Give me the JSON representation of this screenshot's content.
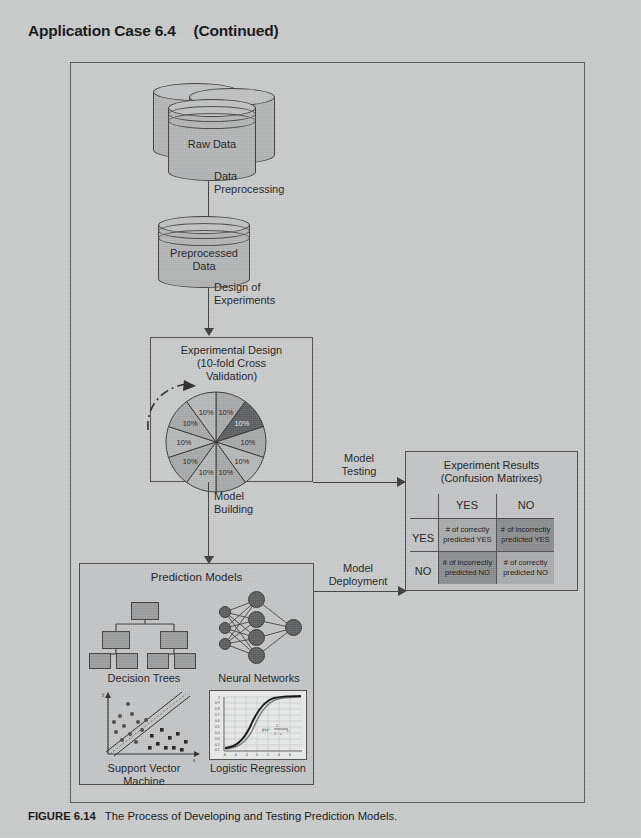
{
  "header": {
    "case_title": "Application Case 6.4",
    "continued": "(Continued)"
  },
  "caption": {
    "figure_number": "FIGURE 6.14",
    "text": "The Process of Developing and Testing Prediction Models."
  },
  "flow": {
    "raw_data": "Raw Data",
    "preprocessed_data": "Preprocessed\nData",
    "preprocessed_line1": "Preprocessed",
    "preprocessed_line2": "Data",
    "arrow1_line1": "Data",
    "arrow1_line2": "Preprocessing",
    "arrow2_line1": "Design of",
    "arrow2_line2": "Experiments",
    "model_building_line1": "Model",
    "model_building_line2": "Building",
    "model_testing_line1": "Model",
    "model_testing_line2": "Testing",
    "model_deployment_line1": "Model",
    "model_deployment_line2": "Deployment"
  },
  "experimental_design": {
    "title_line1": "Experimental Design",
    "title_line2": "(10-fold Cross",
    "title_line3": "Validation)",
    "pie_slice_label": "10%",
    "slice_count": 10,
    "highlighted_slice_index": 1,
    "colors": {
      "slice_light": "#a7a9aa",
      "slice_mid": "#b6b8b9",
      "slice_highlight": "#5d5f60"
    }
  },
  "experiment_results": {
    "title_line1": "Experiment Results",
    "title_line2": "(Confusion Matrixes)",
    "col_headers": [
      "YES",
      "NO"
    ],
    "row_headers": [
      "YES",
      "NO"
    ],
    "cells": [
      [
        "# of correctly\npredicted YES",
        "# of incorrectly\npredicted YES"
      ],
      [
        "# of incorrectly\npredicted NO",
        "# of correctly\npredicted NO"
      ]
    ],
    "cells_flat": {
      "tp_line1": "# of correctly",
      "tp_line2": "predicted YES",
      "fp_line1": "# of incorrectly",
      "fp_line2": "predicted YES",
      "fn_line1": "# of incorrectly",
      "fn_line2": "predicted NO",
      "tn_line1": "# of correctly",
      "tn_line2": "predicted NO"
    },
    "colors": {
      "correct_cell": "#a9abac",
      "incorrect_cell": "#8b8d8e"
    }
  },
  "prediction_models": {
    "title": "Prediction Models",
    "items": [
      {
        "label_line1": "Decision Trees",
        "label_line2": "",
        "icon": "decision-tree-icon"
      },
      {
        "label_line1": "Neural Networks",
        "label_line2": "",
        "icon": "neural-network-icon"
      },
      {
        "label_line1": "Support Vector",
        "label_line2": "Machine",
        "icon": "svm-scatter-icon"
      },
      {
        "label_line1": "Logistic Regression",
        "label_line2": "",
        "icon": "logistic-curve-icon"
      }
    ],
    "logistic_chart": {
      "y_ticks": [
        "1",
        "0.9",
        "0.8",
        "0.7",
        "0.6",
        "0.5",
        "0.4",
        "0.3",
        "0.2",
        "0.1"
      ],
      "x_ticks": [
        "-6",
        "-4",
        "-2",
        "0",
        "2",
        "4",
        "6"
      ],
      "formula": "f(x) = 1 / (1 + e^-x)"
    },
    "svm_chart": {
      "x_axis": "x",
      "y_axis": "y",
      "margin_label": "maximum margin"
    }
  },
  "palette": {
    "page_background": "#c9cbcc",
    "line": "#3b3b3b",
    "box_border": "#4a4a4c",
    "cylinder_fill": "#b3b5b6"
  }
}
